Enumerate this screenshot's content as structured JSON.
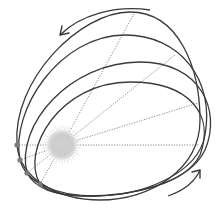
{
  "diagram": {
    "title": "",
    "colors": {
      "orbit": "#3a3a3a",
      "radial": "#8a8a8a",
      "sun": "#cfcfcf",
      "sun_glow": "#e2e2e2",
      "planet": "#7a7a7a",
      "arrow": "#3a3a3a"
    },
    "sun": {
      "cx": 62,
      "cy": 145,
      "r": 15
    },
    "planets": [
      {
        "cx": 17,
        "cy": 145
      },
      {
        "cx": 20,
        "cy": 160
      },
      {
        "cx": 27,
        "cy": 173
      },
      {
        "cx": 40,
        "cy": 184
      }
    ],
    "orbits": [
      {
        "name": "orbit-1",
        "d": "M17,145 C12,80 80,12 130,12 C180,12 200,70 200,120 C200,170 150,200 100,200 C60,200 20,180 17,145 Z"
      },
      {
        "name": "orbit-2",
        "d": "M20,160 C10,110 60,35 125,35 C180,35 215,80 205,135 C198,175 140,196 95,196 C55,196 26,182 20,160 Z"
      },
      {
        "name": "orbit-3",
        "d": "M27,173 C15,125 70,62 140,62 C200,62 222,110 205,150 C188,185 130,196 85,196 C55,196 35,188 27,173 Z"
      },
      {
        "name": "orbit-4",
        "d": "M40,184 C20,150 60,82 130,82 C190,82 215,115 200,155 C185,185 130,196 90,196 C65,196 48,192 40,184 Z"
      }
    ],
    "radials": [
      {
        "x2": 17,
        "y2": 145
      },
      {
        "x2": 20,
        "y2": 160
      },
      {
        "x2": 27,
        "y2": 173
      },
      {
        "x2": 40,
        "y2": 184
      },
      {
        "x2": 135,
        "y2": 12
      },
      {
        "x2": 175,
        "y2": 55
      },
      {
        "x2": 198,
        "y2": 103
      },
      {
        "x2": 199,
        "y2": 145
      }
    ],
    "arrows": [
      {
        "name": "arrow-top",
        "d": "M150,10 C115,5 80,15 60,35",
        "head": "M60,35 L62,26 M60,35 L69,33"
      },
      {
        "name": "arrow-bottom",
        "d": "M168,196 C185,190 195,182 200,170",
        "head": "M200,170 L192,172 M200,170 L200,178"
      }
    ]
  }
}
